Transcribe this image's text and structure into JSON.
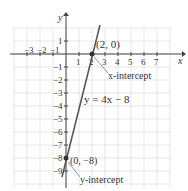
{
  "chart_data": {
    "type": "line",
    "title": "",
    "xlabel": "x",
    "ylabel": "y",
    "xlim": [
      -4,
      8
    ],
    "ylim": [
      -10,
      2
    ],
    "x_ticks": [
      "-3",
      "-2",
      "-1",
      "1",
      "2",
      "3",
      "4",
      "5",
      "6",
      "7"
    ],
    "y_ticks": [
      "1",
      "-1",
      "-2",
      "-3",
      "-4",
      "-5",
      "-6",
      "-7",
      "-8",
      "-9"
    ],
    "series": [
      {
        "name": "y = 4x - 8",
        "x": [
          -0.3,
          2.6
        ],
        "y": [
          -9.2,
          2.4
        ]
      }
    ],
    "points": [
      {
        "x": 2,
        "y": 0,
        "label": "(2, 0)",
        "annotation": "x-intercept"
      },
      {
        "x": 0,
        "y": -8,
        "label": "(0, −8)",
        "annotation": "y-intercept"
      }
    ],
    "grid": true
  },
  "labels": {
    "equation": "y = 4x − 8",
    "x_intercept_point": "(2, 0)",
    "x_intercept_text": "x-intercept",
    "y_intercept_point": "(0, −8)",
    "y_intercept_text": "y-intercept",
    "x_axis": "x",
    "y_axis": "y"
  }
}
